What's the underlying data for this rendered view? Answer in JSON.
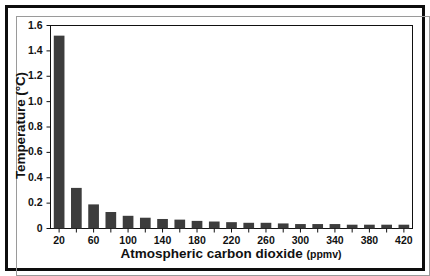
{
  "figure": {
    "frame_color": "#0d0d0d",
    "background": "#ffffff"
  },
  "chart_data": {
    "type": "bar",
    "title": "",
    "subtitle": "",
    "xlabel": "Atmospheric carbon dioxide",
    "xlabel_units": "(ppmv)",
    "ylabel": "Temperature (°C)",
    "categories": [
      20,
      40,
      60,
      80,
      100,
      120,
      140,
      160,
      180,
      200,
      220,
      240,
      260,
      280,
      300,
      320,
      340,
      360,
      380,
      400,
      420
    ],
    "values": [
      1.52,
      0.32,
      0.19,
      0.13,
      0.1,
      0.085,
      0.075,
      0.07,
      0.06,
      0.055,
      0.05,
      0.045,
      0.045,
      0.04,
      0.035,
      0.035,
      0.035,
      0.03,
      0.03,
      0.03,
      0.03
    ],
    "bar_color": "#3d3d3d",
    "xlim": [
      10,
      430
    ],
    "ylim": [
      0,
      1.6
    ],
    "yticks": [
      0,
      0.2,
      0.4,
      0.6,
      0.8,
      1.0,
      1.2,
      1.4,
      1.6
    ],
    "ytick_labels": [
      "0",
      "0.2",
      "0.4",
      "0.6",
      "0.8",
      "1.0",
      "1.2",
      "1.4",
      "1.6"
    ],
    "xticks": [
      20,
      40,
      60,
      80,
      100,
      120,
      140,
      160,
      180,
      200,
      220,
      240,
      260,
      280,
      300,
      320,
      340,
      360,
      380,
      400,
      420
    ],
    "xtick_labels_shown": [
      "20",
      "60",
      "100",
      "140",
      "180",
      "220",
      "260",
      "300",
      "340",
      "380",
      "420"
    ],
    "xtick_values_shown": [
      20,
      60,
      100,
      140,
      180,
      220,
      260,
      300,
      340,
      380,
      420
    ],
    "grid": false,
    "legend": null,
    "legend_position": "none",
    "annotations": []
  }
}
